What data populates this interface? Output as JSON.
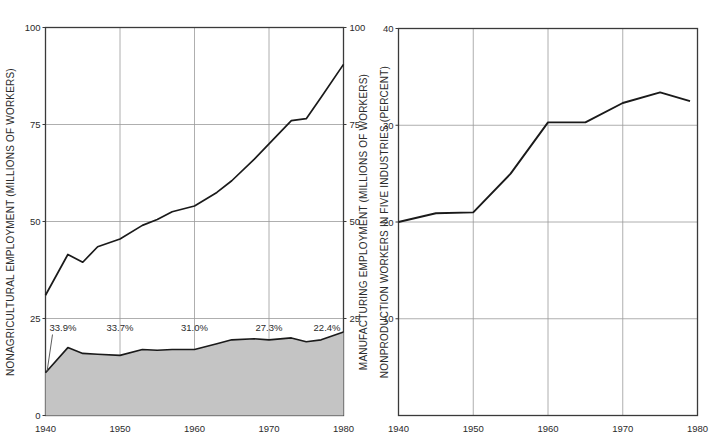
{
  "figure": {
    "background": "#ffffff",
    "axis_color": "#3a3a3a",
    "grid_color": "#9a9a9a",
    "line_color": "#1a1a1a",
    "fill_color": "#c4c4c4",
    "text_color": "#2b2b2b"
  },
  "chart_data": [
    {
      "id": "left",
      "type": "area",
      "title": "",
      "xlabel": "",
      "ylabel": "NONAGRICULTURAL EMPLOYMENT (MILLIONS OF WORKERS)",
      "y2label": "MANUFACTURING EMPLOYMENT (MILLIONS OF WORKERS)",
      "xlim": [
        1940,
        1980
      ],
      "ylim": [
        0,
        100
      ],
      "y2lim": [
        0,
        100
      ],
      "xticks": [
        1940,
        1950,
        1960,
        1970,
        1980
      ],
      "xticklabels": [
        "1940",
        "1950",
        "1960",
        "1970",
        "1980"
      ],
      "yticks": [
        0,
        25,
        50,
        75,
        100
      ],
      "yticklabels": [
        "0",
        "25",
        "50",
        "75",
        "100"
      ],
      "y2ticks": [
        25,
        50,
        75,
        100
      ],
      "y2ticklabels": [
        "25",
        "50",
        "75",
        "100"
      ],
      "grid": true,
      "legend": "none",
      "series": [
        {
          "name": "Nonagricultural employment",
          "kind": "line",
          "x": [
            1940,
            1943,
            1945,
            1947,
            1950,
            1953,
            1955,
            1957,
            1960,
            1963,
            1965,
            1968,
            1970,
            1973,
            1975,
            1977,
            1980
          ],
          "values": [
            31.0,
            41.5,
            39.5,
            43.5,
            45.5,
            49.0,
            50.5,
            52.5,
            54.0,
            57.5,
            60.5,
            66.0,
            70.0,
            76.0,
            76.5,
            82.0,
            90.5
          ]
        },
        {
          "name": "Manufacturing employment",
          "kind": "filled-area",
          "x": [
            1940,
            1943,
            1945,
            1947,
            1950,
            1953,
            1955,
            1957,
            1960,
            1963,
            1965,
            1968,
            1970,
            1973,
            1975,
            1977,
            1980
          ],
          "values": [
            11.0,
            17.5,
            16.0,
            15.8,
            15.5,
            17.0,
            16.8,
            17.0,
            17.0,
            18.5,
            19.5,
            19.8,
            19.5,
            20.0,
            19.0,
            19.5,
            21.5
          ]
        }
      ],
      "annotations": [
        {
          "text": "33.9%",
          "year": 1940,
          "leader": true
        },
        {
          "text": "33.7%",
          "year": 1950,
          "leader": false
        },
        {
          "text": "31.0%",
          "year": 1960,
          "leader": false
        },
        {
          "text": "27.3%",
          "year": 1970,
          "leader": false
        },
        {
          "text": "22.4%",
          "year": 1980,
          "leader": false
        }
      ]
    },
    {
      "id": "right",
      "type": "line",
      "title": "",
      "xlabel": "",
      "ylabel": "NONPRODUCTION WORKERS IN FIVE INDUSTRIES (PERCENT)",
      "xlim": [
        1940,
        1980
      ],
      "ylim": [
        0,
        40
      ],
      "xticks": [
        1940,
        1950,
        1960,
        1970,
        1980
      ],
      "xticklabels": [
        "1940",
        "1950",
        "1960",
        "1970",
        "1980"
      ],
      "yticks": [
        10,
        20,
        30,
        40
      ],
      "yticklabels": [
        "10",
        "20",
        "30",
        "40"
      ],
      "grid": true,
      "legend": "none",
      "series": [
        {
          "name": "Nonproduction workers",
          "kind": "line",
          "x": [
            1940,
            1945,
            1950,
            1955,
            1960,
            1965,
            1970,
            1975,
            1979
          ],
          "values": [
            20.0,
            20.9,
            21.0,
            25.0,
            30.3,
            30.3,
            32.3,
            33.4,
            32.5
          ]
        }
      ],
      "annotations": []
    }
  ]
}
